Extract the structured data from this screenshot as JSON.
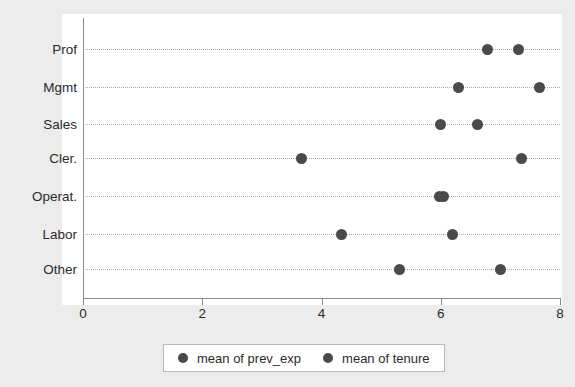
{
  "chart_data": {
    "type": "scatter",
    "title": "",
    "xlabel": "",
    "ylabel": "",
    "xlim": [
      0,
      8
    ],
    "xticks": [
      "0",
      "2",
      "4",
      "6",
      "8"
    ],
    "categories": [
      "Prof",
      "Mgmt",
      "Sales",
      "Cler.",
      "Operat.",
      "Labor",
      "Other"
    ],
    "grid": true,
    "grid_style": "dotted horizontal",
    "legend_position": "bottom",
    "orientation": "horizontal",
    "marker": "filled-circle",
    "marker_color": "#4a4a4a",
    "series": [
      {
        "name": "mean of prev_exp",
        "values": [
          6.78,
          6.29,
          6.0,
          3.66,
          5.98,
          4.33,
          5.3
        ]
      },
      {
        "name": "mean of tenure",
        "values": [
          7.3,
          7.65,
          6.62,
          7.36,
          6.05,
          6.2,
          7.0
        ]
      }
    ]
  },
  "legend": {
    "entries": [
      {
        "label": "mean of prev_exp"
      },
      {
        "label": "mean of tenure"
      }
    ]
  },
  "colors": {
    "marker": "#4a4a4a",
    "plot_background": "#ffffff",
    "page_background": "#ececec",
    "axis": "#8a8a8a",
    "grid": "#9aa3b0",
    "text": "#2b2b2b"
  }
}
